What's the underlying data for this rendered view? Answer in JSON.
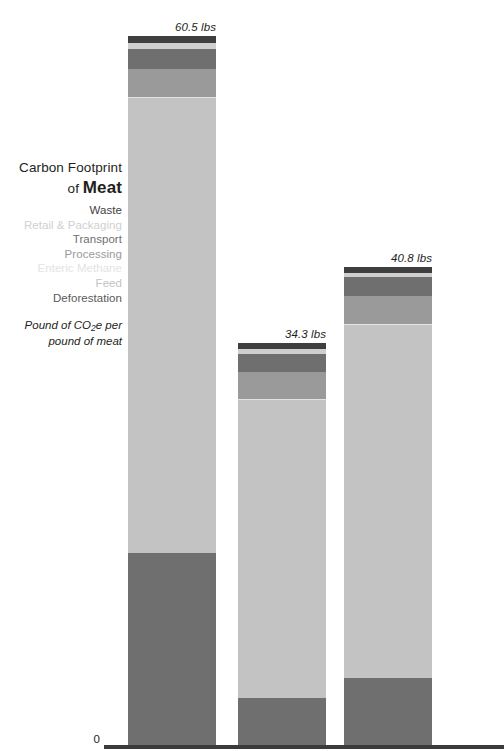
{
  "title": {
    "line1": "Carbon Footprint",
    "line2_prefix": "of ",
    "line2_strong": "Meat"
  },
  "subtitle": {
    "line1_pre": "Pound of CO",
    "line1_sub": "2",
    "line1_post": "e per",
    "line2": "pound of meat"
  },
  "axis": {
    "zero_label": "0"
  },
  "chart_data": {
    "type": "bar",
    "subtype": "stacked",
    "title": "Carbon Footprint of Meat",
    "subtitle": "Pound of CO2e per pound of meat",
    "xlabel": "",
    "ylabel": "Pound of CO2e per pound of meat",
    "ylim": [
      0,
      60.5
    ],
    "grid": false,
    "legend_position": "left",
    "units": "lbs",
    "categories": [
      "Bar 1",
      "Bar 2",
      "Bar 3"
    ],
    "totals": [
      60.5,
      34.3,
      40.8
    ],
    "total_labels": [
      "60.5 lbs",
      "34.3 lbs",
      "40.8 lbs"
    ],
    "stack_order_top_to_bottom": [
      "Waste",
      "Retail & Packaging",
      "Transport",
      "Processing",
      "Enteric Methane",
      "Feed",
      "Deforestation"
    ],
    "series": [
      {
        "name": "Waste",
        "color": "#3f3f3f",
        "values": [
          0.6,
          0.5,
          0.5
        ]
      },
      {
        "name": "Retail & Packaging",
        "color": "#cfcfcf",
        "values": [
          0.5,
          0.4,
          0.4
        ]
      },
      {
        "name": "Transport",
        "color": "#6f6f6f",
        "values": [
          1.7,
          1.6,
          1.6
        ]
      },
      {
        "name": "Processing",
        "color": "#9a9a9a",
        "values": [
          2.4,
          2.3,
          2.4
        ]
      },
      {
        "name": "Enteric Methane",
        "color": "#e3e3e3",
        "values": [
          0.1,
          0.1,
          0.1
        ]
      },
      {
        "name": "Feed",
        "color": "#c3c3c3",
        "values": [
          38.8,
          25.4,
          30.1
        ]
      },
      {
        "name": "Deforestation",
        "color": "#6f6f6f",
        "values": [
          16.4,
          4.0,
          5.7
        ]
      }
    ],
    "legend_entries": [
      {
        "label": "Waste",
        "text_color": "#3f3f3f"
      },
      {
        "label": "Retail & Packaging",
        "text_color": "#cfcfcf"
      },
      {
        "label": "Transport",
        "text_color": "#6f6f6f"
      },
      {
        "label": "Processing",
        "text_color": "#9a9a9a"
      },
      {
        "label": "Enteric Methane",
        "text_color": "#e3e3e3"
      },
      {
        "label": "Feed",
        "text_color": "#c3c3c3"
      },
      {
        "label": "Deforestation",
        "text_color": "#5a5a5a"
      }
    ]
  }
}
